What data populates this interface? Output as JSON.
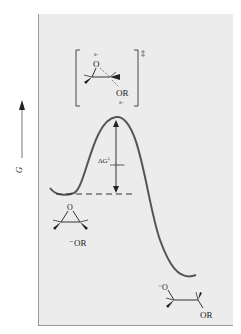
{
  "axis": {
    "label": "G",
    "direction": "up"
  },
  "transition_state": {
    "dagger": "‡",
    "oxygen_label": "O",
    "oxygen_charge": "δ−",
    "leaving_group_label": "OR",
    "leaving_group_charge": "δ−"
  },
  "barrier": {
    "label_main": "ΔG",
    "label_dagger": "‡",
    "label_subscript": "oxirane"
  },
  "reactant": {
    "oxygen_label": "O",
    "nucleophile_label": "⁻OR"
  },
  "product": {
    "oxygen_label": "⁻O",
    "substituent_label": "OR"
  },
  "colors": {
    "panel_bg": "#ececec",
    "curve": "#555555",
    "text": "#222222"
  }
}
